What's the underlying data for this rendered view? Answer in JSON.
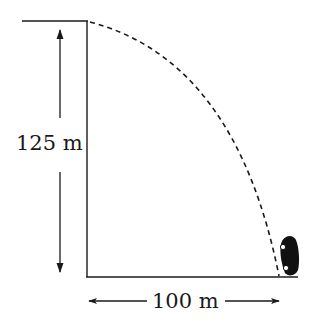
{
  "diagram": {
    "type": "projectile-from-cliff",
    "height_label": "125 m",
    "distance_label": "100 m",
    "colors": {
      "line": "#1a1a1a",
      "background": "#ffffff"
    },
    "objects": [
      "cliff",
      "ground",
      "dashed-trajectory",
      "car",
      "height-dimension-arrow",
      "distance-dimension-arrow"
    ]
  }
}
